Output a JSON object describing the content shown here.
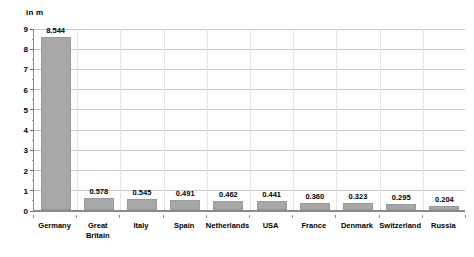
{
  "chart_data": {
    "type": "bar",
    "title": "",
    "subtitle": "",
    "xlabel": "",
    "ylabel": "in m",
    "ylim": [
      0,
      9
    ],
    "ytick_labels": [
      "0",
      "1",
      "2",
      "3",
      "4",
      "5",
      "6",
      "7",
      "8",
      "9"
    ],
    "ytick_values": [
      0,
      1,
      2,
      3,
      4,
      5,
      6,
      7,
      8,
      9
    ],
    "minor_ticks_per_major": 2,
    "grid": true,
    "grid_horizontal": true,
    "grid_vertical": true,
    "legend": false,
    "categories": [
      "Germany",
      "Great Britain",
      "Italy",
      "Spain",
      "Netherlands",
      "USA",
      "France",
      "Denmark",
      "Switzerland",
      "Russia"
    ],
    "values": [
      8.544,
      0.578,
      0.545,
      0.491,
      0.462,
      0.441,
      0.36,
      0.323,
      0.295,
      0.204
    ],
    "value_labels": [
      "8.544",
      "0.578",
      "0.545",
      "0.491",
      "0.462",
      "0.441",
      "0.360",
      "0.323",
      "0.295",
      "0.204"
    ],
    "bar_color": "#a8a8a8",
    "grid_color": "#c9c9c9",
    "axis_color": "#8a8a8a",
    "text_color": "#000000",
    "background": "#ffffff"
  }
}
